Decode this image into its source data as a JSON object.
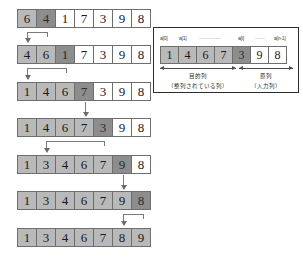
{
  "diagram": {
    "colors": {
      "sorted": "#b9b9b9",
      "key": "#8d8d8d",
      "input": "#ffffff",
      "border": "#6e6e6e",
      "arrow": "#7a7a7a",
      "panel_border": "#2c2c2c"
    },
    "rows": [
      {
        "name": "step-1",
        "values": [
          6,
          4,
          1,
          7,
          3,
          9,
          8
        ],
        "states": [
          "sorted",
          "key",
          "input",
          "input",
          "input",
          "input",
          "input"
        ]
      },
      {
        "name": "step-2",
        "values": [
          4,
          6,
          1,
          7,
          3,
          9,
          8
        ],
        "states": [
          "sorted",
          "sorted",
          "key",
          "input",
          "input",
          "input",
          "input"
        ]
      },
      {
        "name": "step-3",
        "values": [
          1,
          4,
          6,
          7,
          3,
          9,
          8
        ],
        "states": [
          "sorted",
          "sorted",
          "sorted",
          "key",
          "input",
          "input",
          "input"
        ]
      },
      {
        "name": "step-4",
        "values": [
          1,
          4,
          6,
          7,
          3,
          9,
          8
        ],
        "states": [
          "sorted",
          "sorted",
          "sorted",
          "sorted",
          "key",
          "input",
          "input"
        ]
      },
      {
        "name": "step-5",
        "values": [
          1,
          3,
          4,
          6,
          7,
          9,
          8
        ],
        "states": [
          "sorted",
          "sorted",
          "sorted",
          "sorted",
          "sorted",
          "key",
          "input"
        ]
      },
      {
        "name": "step-6",
        "values": [
          1,
          3,
          4,
          6,
          7,
          9,
          8
        ],
        "states": [
          "sorted",
          "sorted",
          "sorted",
          "sorted",
          "sorted",
          "sorted",
          "key"
        ]
      },
      {
        "name": "step-7-final",
        "values": [
          1,
          3,
          4,
          6,
          7,
          8,
          9
        ],
        "states": [
          "sorted",
          "sorted",
          "sorted",
          "sorted",
          "sorted",
          "sorted",
          "sorted"
        ]
      }
    ]
  },
  "legend": {
    "index_labels": {
      "first": "a[0]",
      "second": "a[1]",
      "i": "a[i]",
      "last": "a[n-1]"
    },
    "dots_left": "················",
    "dots_right": "·······",
    "values": [
      1,
      4,
      6,
      7,
      3,
      9,
      8
    ],
    "states": [
      "sorted",
      "sorted",
      "sorted",
      "sorted",
      "key",
      "input",
      "input"
    ],
    "left_caption": "目的列",
    "left_subcaption": "（整列されている列）",
    "right_caption": "原列",
    "right_subcaption": "（入力列）"
  }
}
